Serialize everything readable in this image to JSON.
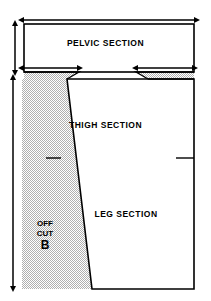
{
  "diagram": {
    "labels": {
      "pelvic": "PELVIC SECTION",
      "thigh": "THIGH  SECTION",
      "leg": "LEG SECTION",
      "offcut_line1": "OFF",
      "offcut_line2": "CUT",
      "offcut_line3": "B"
    },
    "colors": {
      "line": "#000000",
      "fill": "#ffffff",
      "stipple": "#b8b8b8",
      "background": "#ffffff"
    },
    "dimension_arrows": [
      {
        "name": "overall-width-arrow",
        "orientation": "horizontal",
        "x1": 22,
        "x2": 196,
        "y": 20
      },
      {
        "name": "pelvic-height-arrow",
        "orientation": "vertical",
        "x": 15,
        "y1": 24,
        "y2": 72
      },
      {
        "name": "left-shoulder-arrow",
        "orientation": "horizontal",
        "x1": 22,
        "x2": 79,
        "y": 68
      },
      {
        "name": "right-shoulder-arrow",
        "orientation": "horizontal",
        "x1": 136,
        "x2": 194,
        "y": 68
      },
      {
        "name": "total-length-arrow",
        "orientation": "vertical",
        "x": 13,
        "y1": 79,
        "y2": 287
      }
    ],
    "outline_points": {
      "pelvic_rect": {
        "left": 24,
        "top": 24,
        "right": 194,
        "bottom": 72
      },
      "thigh_left_top": {
        "x": 67,
        "y": 79
      },
      "thigh_right_top": {
        "x": 194,
        "y": 79
      },
      "leg_bottom_left": {
        "x": 92,
        "y": 289
      },
      "leg_bottom_right": {
        "x": 194,
        "y": 289
      }
    },
    "notches": [
      {
        "name": "left-notch-tick",
        "x": 54,
        "y": 158
      },
      {
        "name": "right-notch-tick",
        "x": 183,
        "y": 158
      }
    ]
  }
}
